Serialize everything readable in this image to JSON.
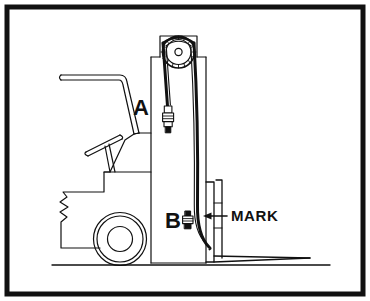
{
  "figure": {
    "background_color": "#FFFFFF",
    "ink_color": "#111111",
    "border": {
      "name": "outer-frame",
      "style": "thick black rectangle outline",
      "color": "#111111",
      "stroke_width_px": 6,
      "margin_px": 6
    },
    "labels": [
      {
        "id": "label-a",
        "text": "A",
        "kind": "callout-letter",
        "refers_to": "upper lift chain anchor / turnbuckle adjuster",
        "x": 141,
        "y": 115
      },
      {
        "id": "label-b",
        "text": "B",
        "kind": "callout-letter",
        "refers_to": "lower lift chain anchor / adjuster nut",
        "x": 173,
        "y": 228
      },
      {
        "id": "label-mark",
        "text": "MARK",
        "kind": "callout-word",
        "refers_to": "reference mark on inner mast rail",
        "x": 231,
        "y": 221,
        "leader": "horizontal line with left-pointing arrowhead"
      }
    ],
    "components": [
      {
        "name": "ground-line",
        "description": "horizontal ground reference line"
      },
      {
        "name": "drive-wheel",
        "description": "drive wheel with concentric tire, rim and hub circles"
      },
      {
        "name": "truck-body",
        "description": "forklift body with counterweight notch profile"
      },
      {
        "name": "overhead-guard",
        "description": "operator overhead guard / backrest frame"
      },
      {
        "name": "steering-wheel",
        "description": "steering wheel shown edge-on"
      },
      {
        "name": "mast-assembly",
        "description": "upright mast with stepped upper and lower sections"
      },
      {
        "name": "chain-sprocket",
        "description": "toothed chain sheave at top of mast"
      },
      {
        "name": "lift-chain",
        "description": "lift chain routed over the sprocket, down both mast sides"
      },
      {
        "name": "turnbuckle-adjuster",
        "description": "threaded chain adjuster with stacked nuts at point A"
      },
      {
        "name": "lower-chain-anchor",
        "description": "chain anchor bolt with nuts at point B"
      },
      {
        "name": "fork-carriage",
        "description": "carriage rails that the forks hang from"
      },
      {
        "name": "fork-blade",
        "description": "horizontal fork blade tapering to the tip"
      }
    ]
  }
}
